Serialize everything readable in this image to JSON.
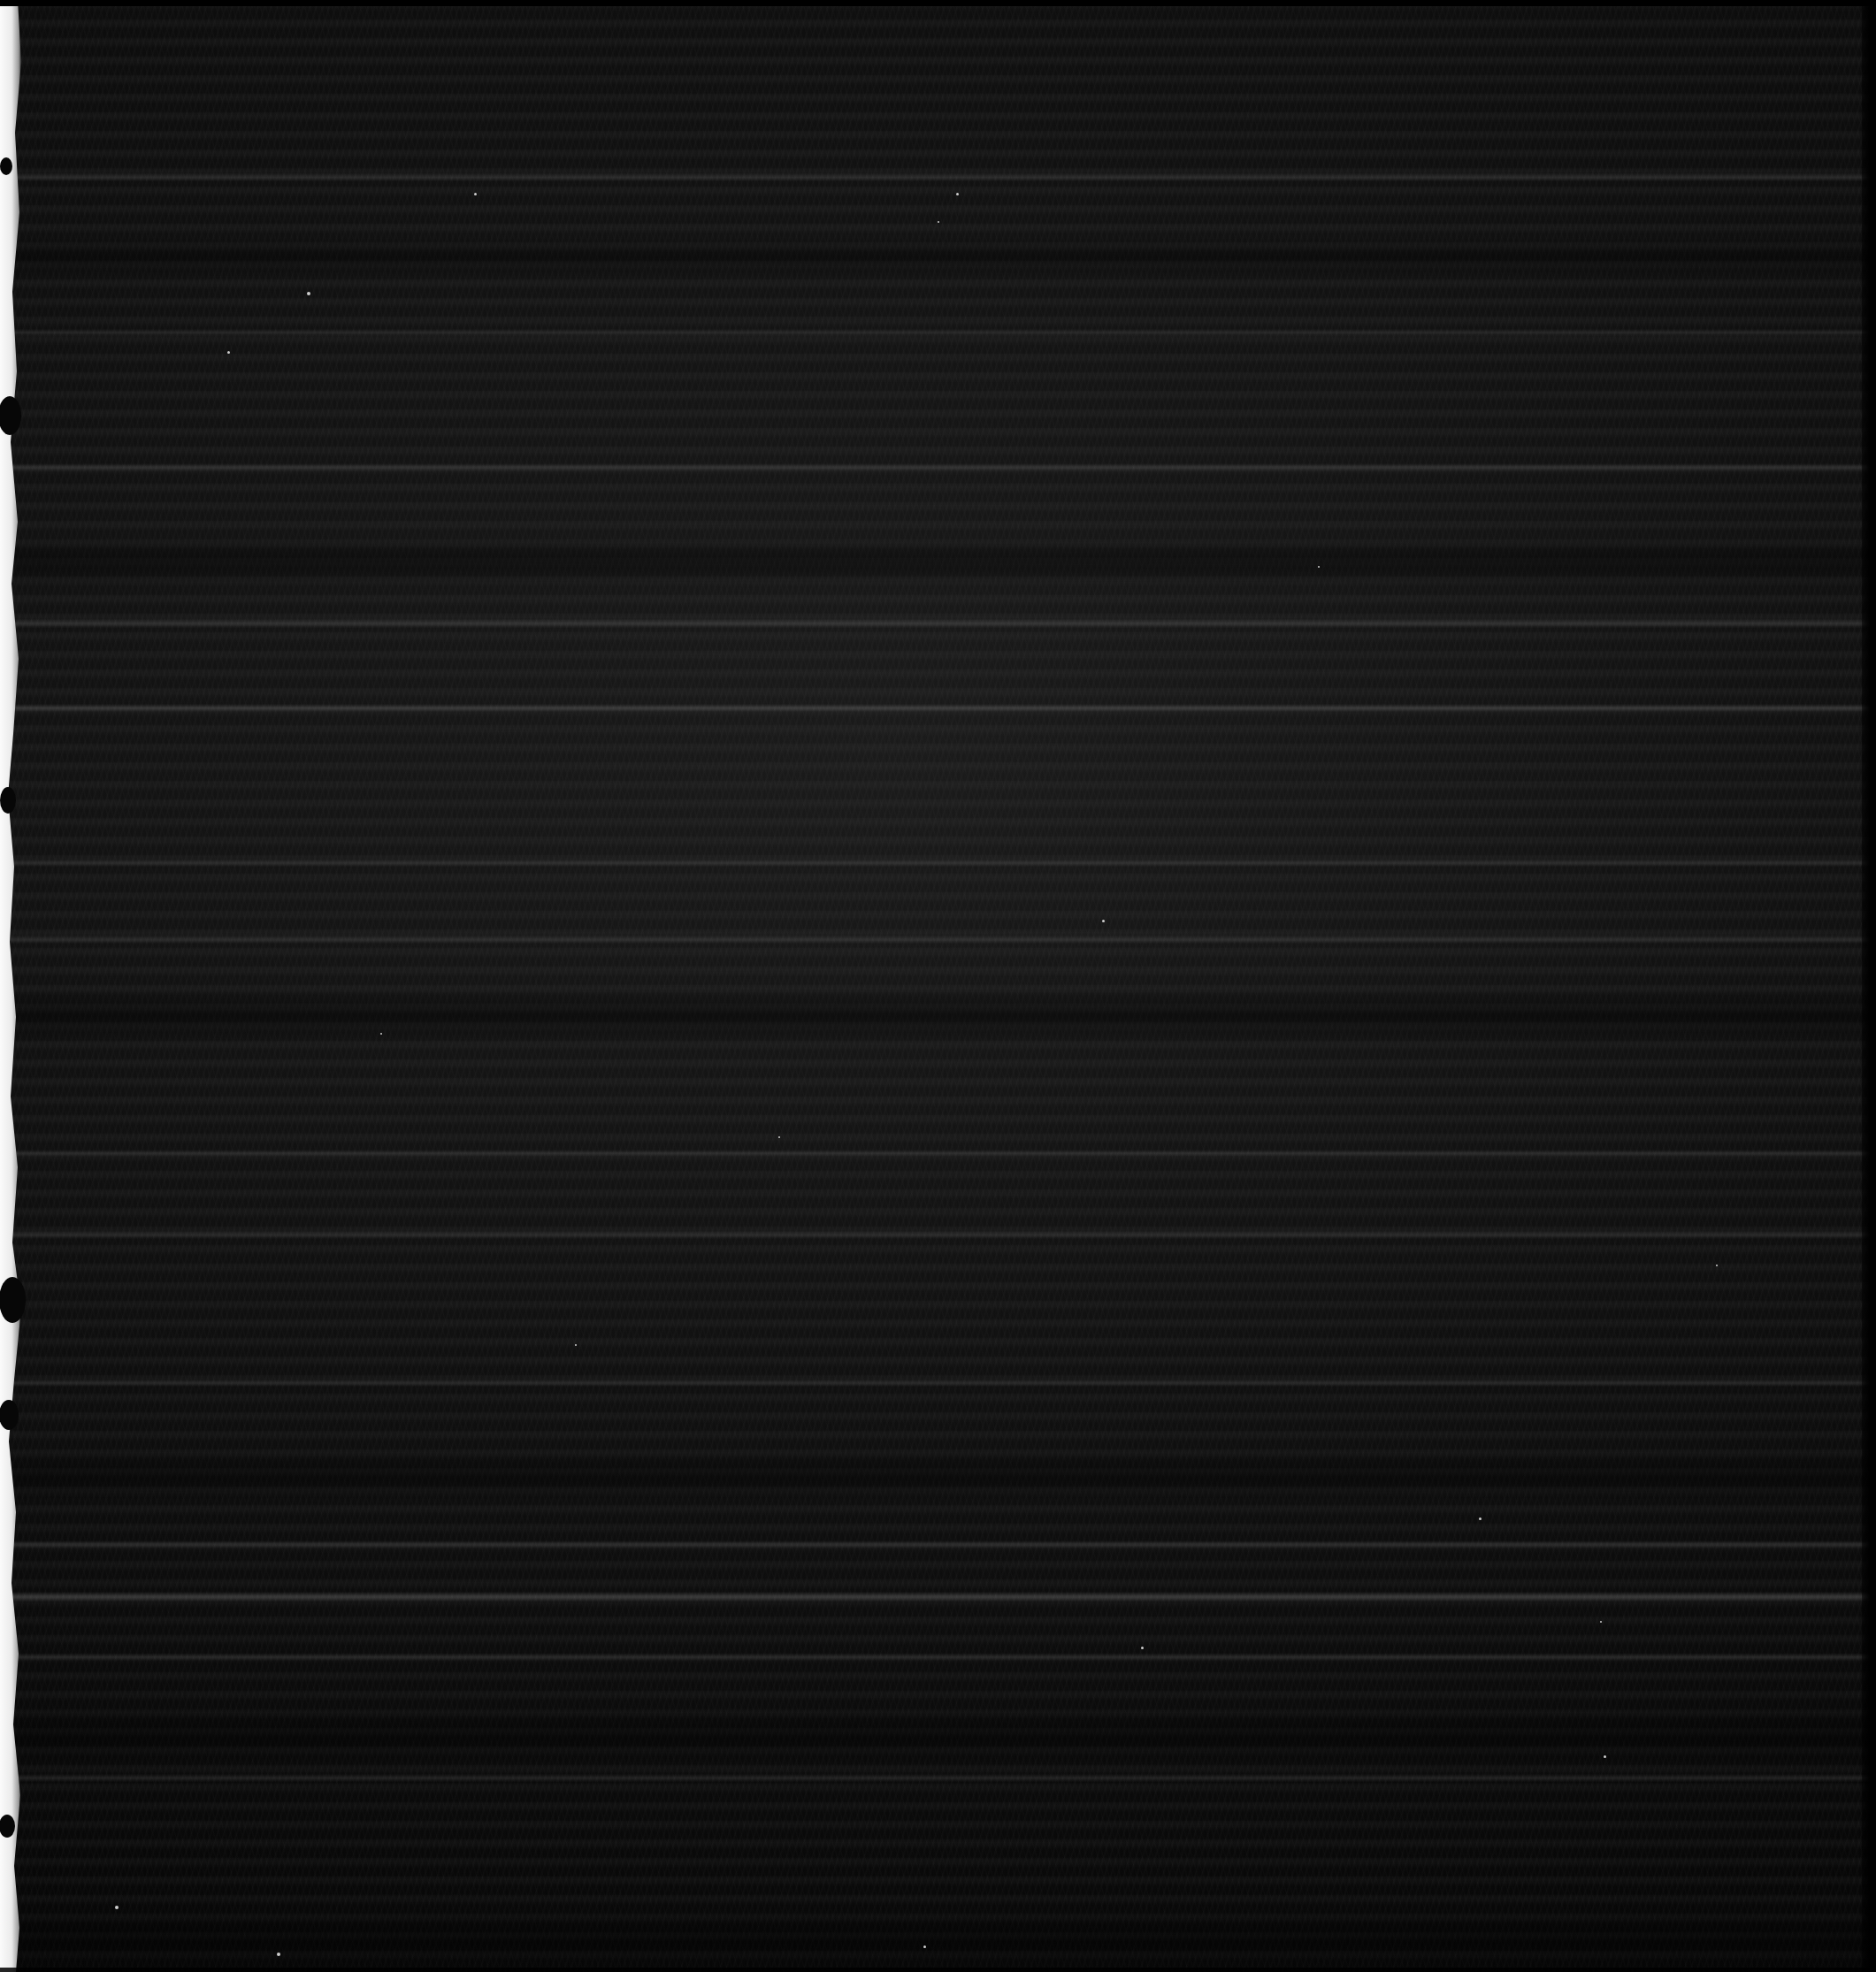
{
  "document": {
    "kind": "scanned-page",
    "appearance": "near-black underexposed scan",
    "legible_text": "",
    "width_px": 2121,
    "height_px": 2230
  },
  "colors": {
    "page_background": "#060606",
    "field_highlight": "#1c1c1c",
    "margin_strip": "#f2f2f2",
    "margin_shadow": "#0a0a0a",
    "edge_black": "#000000",
    "speck": "#cfcfcf"
  },
  "margin_strip": {
    "side": "left",
    "nominal_width_px": 18,
    "description": "ragged white paper edge",
    "blobs": [
      {
        "cx": 11,
        "cy": 470,
        "rx": 13,
        "ry": 22
      },
      {
        "cx": 9,
        "cy": 905,
        "rx": 9,
        "ry": 15
      },
      {
        "cx": 14,
        "cy": 1470,
        "rx": 15,
        "ry": 26
      },
      {
        "cx": 10,
        "cy": 1600,
        "rx": 11,
        "ry": 17
      },
      {
        "cx": 7,
        "cy": 188,
        "rx": 7,
        "ry": 10
      },
      {
        "cx": 8,
        "cy": 2065,
        "rx": 9,
        "ry": 13
      }
    ],
    "outline_points": "0,0 20,0 24,70 17,150 22,240 14,330 19,420 12,500 20,590 13,660 21,745 15,830 9,900 16,980 11,1065 18,1150 12,1240 20,1320 14,1405 24,1480 16,1560 10,1630 18,1710 13,1790 21,1870 15,1950 23,2030 16,2110 22,2180 18,2230 0,2230"
  },
  "ruled_bands": [
    {
      "top": 196,
      "height": 9,
      "opacity": 0.18
    },
    {
      "top": 372,
      "height": 8,
      "opacity": 0.14
    },
    {
      "top": 524,
      "height": 9,
      "opacity": 0.16
    },
    {
      "top": 700,
      "height": 10,
      "opacity": 0.2
    },
    {
      "top": 796,
      "height": 9,
      "opacity": 0.22
    },
    {
      "top": 972,
      "height": 8,
      "opacity": 0.15
    },
    {
      "top": 1058,
      "height": 9,
      "opacity": 0.17
    },
    {
      "top": 1300,
      "height": 8,
      "opacity": 0.14
    },
    {
      "top": 1392,
      "height": 9,
      "opacity": 0.16
    },
    {
      "top": 1560,
      "height": 8,
      "opacity": 0.15
    },
    {
      "top": 1742,
      "height": 9,
      "opacity": 0.17
    },
    {
      "top": 1800,
      "height": 11,
      "opacity": 0.3
    },
    {
      "top": 1870,
      "height": 8,
      "opacity": 0.14
    },
    {
      "top": 2006,
      "height": 9,
      "opacity": 0.16
    }
  ],
  "dark_bands": [
    {
      "top": 268,
      "height": 46,
      "opacity": 0.45
    },
    {
      "top": 608,
      "height": 54,
      "opacity": 0.5
    },
    {
      "top": 1118,
      "height": 62,
      "opacity": 0.52
    },
    {
      "top": 1640,
      "height": 58,
      "opacity": 0.48
    },
    {
      "top": 1930,
      "height": 66,
      "opacity": 0.5
    },
    {
      "top": 2160,
      "height": 70,
      "opacity": 0.55
    }
  ],
  "speckles": [
    {
      "x": 347,
      "y": 330,
      "size": 4
    },
    {
      "x": 257,
      "y": 397,
      "size": 3
    },
    {
      "x": 536,
      "y": 218,
      "size": 3
    },
    {
      "x": 1081,
      "y": 218,
      "size": 3
    },
    {
      "x": 1060,
      "y": 250,
      "size": 2
    },
    {
      "x": 1246,
      "y": 1040,
      "size": 3
    },
    {
      "x": 1672,
      "y": 1716,
      "size": 3
    },
    {
      "x": 1809,
      "y": 1833,
      "size": 2
    },
    {
      "x": 1813,
      "y": 1985,
      "size": 3
    },
    {
      "x": 1044,
      "y": 2200,
      "size": 3
    },
    {
      "x": 130,
      "y": 2155,
      "size": 4
    },
    {
      "x": 313,
      "y": 2208,
      "size": 4
    },
    {
      "x": 650,
      "y": 1520,
      "size": 2
    },
    {
      "x": 1940,
      "y": 1430,
      "size": 2
    },
    {
      "x": 1490,
      "y": 640,
      "size": 2
    },
    {
      "x": 880,
      "y": 1285,
      "size": 2
    },
    {
      "x": 1290,
      "y": 1862,
      "size": 3
    },
    {
      "x": 430,
      "y": 1168,
      "size": 2
    }
  ]
}
